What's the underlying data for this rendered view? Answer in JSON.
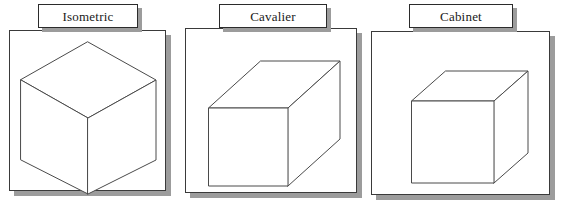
{
  "figure": {
    "background_color": "#ffffff",
    "line_color": "#4a4a4a",
    "shadow_color": "#9c9c9c",
    "frame_color": "#3a3a3a",
    "label_text_color": "#1a1a1a"
  },
  "panels": [
    {
      "id": "isometric",
      "label": "Isometric",
      "frame": {
        "x": 9,
        "y": 30,
        "width": 157,
        "height": 161
      },
      "shadow_offset": {
        "x": 5,
        "y": 5
      },
      "label_box": {
        "x": 38,
        "y": 4,
        "width": 100,
        "height": 24
      },
      "projection": {
        "type": "isometric",
        "description": "Three equally foreshortened axes at 120 degrees; top, left and right faces visible.",
        "vertices": {
          "top_apex": [
            78,
            11
          ],
          "left_upper": [
            11,
            49
          ],
          "right_upper": [
            146,
            49
          ],
          "center": [
            78,
            87
          ],
          "left_lower": [
            11,
            129
          ],
          "right_lower": [
            146,
            129
          ],
          "bottom_apex": [
            78,
            163
          ]
        }
      }
    },
    {
      "id": "cavalier",
      "label": "Cavalier",
      "frame": {
        "x": 185,
        "y": 28,
        "width": 172,
        "height": 165
      },
      "shadow_offset": {
        "x": 5,
        "y": 5
      },
      "label_box": {
        "x": 219,
        "y": 4,
        "width": 108,
        "height": 24
      },
      "projection": {
        "type": "cavalier oblique",
        "description": "Front face true size; receding edges drawn at full depth (scale 1.0) at about 42 degrees.",
        "front_face": {
          "x": 23,
          "y": 79,
          "width": 79,
          "height": 78
        },
        "depth_offset": [
          52,
          -47
        ],
        "depth_scale": 1.0
      }
    },
    {
      "id": "cabinet",
      "label": "Cabinet",
      "frame": {
        "x": 371,
        "y": 31,
        "width": 179,
        "height": 164
      },
      "shadow_offset": {
        "x": 5,
        "y": 5
      },
      "label_box": {
        "x": 409,
        "y": 4,
        "width": 104,
        "height": 24
      },
      "projection": {
        "type": "cabinet oblique",
        "description": "Front face true size; receding edges drawn at half depth (scale 0.5) at about 42 degrees.",
        "front_face": {
          "x": 40,
          "y": 69,
          "width": 82,
          "height": 82
        },
        "depth_offset": [
          34,
          -30
        ],
        "depth_scale": 0.5
      }
    }
  ]
}
